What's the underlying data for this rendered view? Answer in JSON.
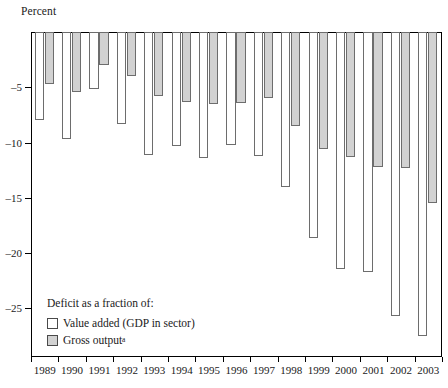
{
  "chart_data": {
    "type": "bar",
    "title": "",
    "ylabel": "Percent",
    "xlabel": "",
    "ylim": [
      -29.4,
      0
    ],
    "yticks": [
      -5,
      -10,
      -15,
      -20,
      -25
    ],
    "ytick_labels": [
      "–5",
      "–10",
      "–15",
      "–20",
      "–25"
    ],
    "grid": false,
    "legend_position": "inside-bottom-left",
    "legend_title": "Deficit as a fraction of:",
    "categories": [
      "1989",
      "1990",
      "1991",
      "1992",
      "1993",
      "1994",
      "1995",
      "1996",
      "1997",
      "1998",
      "1999",
      "2000",
      "2001",
      "2002",
      "2003"
    ],
    "series": [
      {
        "name": "Value added (GDP in sector)",
        "color": "#ffffff",
        "values": [
          -8.0,
          -9.7,
          -5.2,
          -8.3,
          -11.1,
          -10.3,
          -11.4,
          -10.2,
          -11.2,
          -14.0,
          -18.6,
          -21.4,
          -21.7,
          -25.7,
          -27.5
        ]
      },
      {
        "name": "Gross output",
        "color": "#d2d2d2",
        "values": [
          -4.7,
          -5.4,
          -3.0,
          -4.0,
          -5.8,
          -6.3,
          -6.5,
          -6.4,
          -6.0,
          -8.5,
          -10.6,
          -11.3,
          -12.2,
          -12.3,
          -15.5
        ]
      }
    ]
  },
  "legend": {
    "title": "Deficit as a fraction of:",
    "items": [
      {
        "label": "Value added (GDP in sector)",
        "note": ""
      },
      {
        "label": "Gross output",
        "note": "a"
      }
    ]
  },
  "axis": {
    "y_caption": "Percent"
  }
}
